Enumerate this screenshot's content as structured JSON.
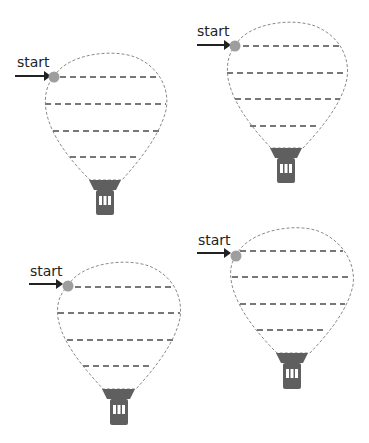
{
  "worksheet": {
    "start_label": "start",
    "colors": {
      "outline": "#8a8a8a",
      "trace_line": "#777777",
      "start_dot": "#9e9e9e",
      "basket": "#5f5f5f",
      "arrow": "#222222"
    },
    "balloons": [
      {
        "label": "start",
        "position": "top-left"
      },
      {
        "label": "start",
        "position": "top-right"
      },
      {
        "label": "start",
        "position": "bottom-left"
      },
      {
        "label": "start",
        "position": "bottom-right"
      }
    ]
  }
}
